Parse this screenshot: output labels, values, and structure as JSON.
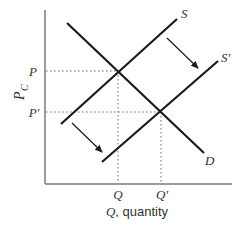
{
  "diagram": {
    "type": "supply-demand-shift",
    "axes": {
      "y_label_main": "P",
      "y_label_sub": "C",
      "x_label_var": "Q",
      "x_label_rest": ", quantity",
      "color": "#7a7a7a"
    },
    "price_ticks": [
      {
        "label": "P",
        "y": 71
      },
      {
        "label": "P'",
        "y": 112
      }
    ],
    "quantity_ticks": [
      {
        "label": "Q",
        "x": 118
      },
      {
        "label": "Q'",
        "x": 161
      }
    ],
    "curves": [
      {
        "name": "D",
        "label": "D",
        "from": [
          67,
          23
        ],
        "to": [
          204,
          153
        ]
      },
      {
        "name": "S",
        "label": "S",
        "from": [
          90,
          127
        ],
        "to": [
          177,
          19
        ]
      },
      {
        "name": "S'",
        "label": "S'",
        "from": [
          102,
          162
        ],
        "to": [
          218,
          61
        ]
      }
    ],
    "shift_arrows": [
      {
        "from": [
          167,
          38
        ],
        "to": [
          200,
          70
        ]
      },
      {
        "from": [
          72,
          123
        ],
        "to": [
          104,
          154
        ]
      }
    ],
    "equilibria": [
      {
        "label": "original",
        "x": 118,
        "y": 71
      },
      {
        "label": "new",
        "x": 161,
        "y": 112
      }
    ],
    "line_color": "#1a1a1a",
    "guide_color": "#666666"
  }
}
